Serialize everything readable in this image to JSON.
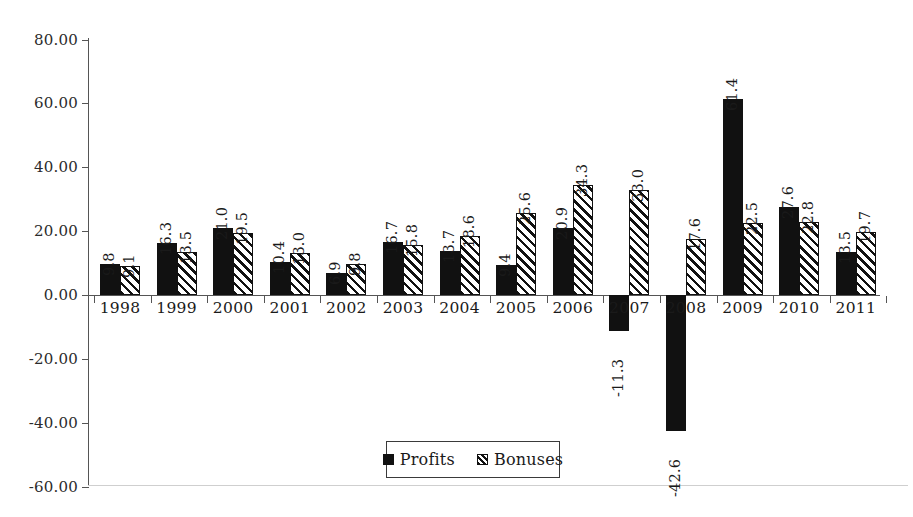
{
  "chart_data": {
    "type": "bar",
    "title": "",
    "subtitle": "",
    "xlabel": "",
    "ylabel": "",
    "categories": [
      "1998",
      "1999",
      "2000",
      "2001",
      "2002",
      "2003",
      "2004",
      "2005",
      "2006",
      "2007",
      "2008",
      "2009",
      "2010",
      "2011"
    ],
    "series": [
      {
        "name": "Profits",
        "fill": "solid-black",
        "color": "#111111",
        "values": [
          9.8,
          16.3,
          21.0,
          10.4,
          6.9,
          16.7,
          13.7,
          9.4,
          20.9,
          -11.3,
          -42.6,
          61.4,
          27.6,
          13.5
        ],
        "labels": [
          "9.8",
          "16.3",
          "21.0",
          "10.4",
          "6.9",
          "16.7",
          "13.7",
          "9.4",
          "20.9",
          "-11.3",
          "-42.6",
          "61.4",
          "27.6",
          "13.5"
        ]
      },
      {
        "name": "Bonuses",
        "fill": "diagonal-hatch",
        "color": "#ffffff",
        "values": [
          9.1,
          13.5,
          19.5,
          13.0,
          9.8,
          15.8,
          18.6,
          25.6,
          34.3,
          33.0,
          17.6,
          22.5,
          22.8,
          19.7
        ],
        "labels": [
          "9.1",
          "13.5",
          "19.5",
          "13.0",
          "9.8",
          "15.8",
          "18.6",
          "25.6",
          "34.3",
          "33.0",
          "17.6",
          "22.5",
          "22.8",
          "19.7"
        ]
      }
    ],
    "ylim": [
      -60,
      80
    ],
    "ytick_values": [
      80,
      60,
      40,
      20,
      0,
      -20,
      -40,
      -60
    ],
    "ytick_labels": [
      "80.00",
      "60.00",
      "40.00",
      "20.00",
      "0.00",
      "-20.00",
      "-40.00",
      "-60.00"
    ],
    "grid": false,
    "legend_position": "bottom-center",
    "legend_entries": [
      "Profits",
      "Bonuses"
    ],
    "data_labels_shown": true,
    "data_label_orientation": "vertical"
  },
  "legend": {
    "profits_label": "Profits",
    "bonuses_label": "Bonuses"
  }
}
